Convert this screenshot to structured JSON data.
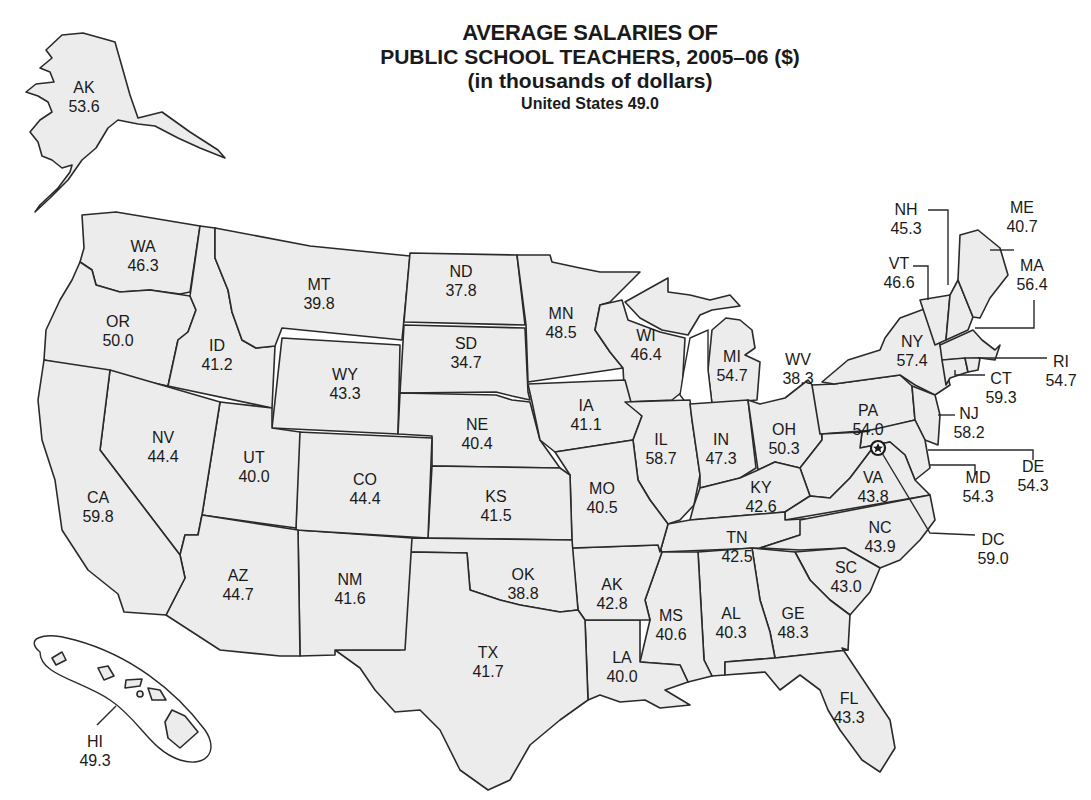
{
  "title": {
    "line1": "AVERAGE SALARIES OF",
    "line2": "PUBLIC SCHOOL TEACHERS, 2005–06 ($)",
    "line3": "(in thousands of dollars)",
    "line4": "United States 49.0"
  },
  "colors": {
    "state_fill": "#ececec",
    "outline": "#2a2a2a",
    "background": "#ffffff",
    "text": "#1a1a1a"
  },
  "icons": {
    "capital_marker": "star-icon"
  },
  "states": [
    {
      "code": "AK",
      "value": "53.6",
      "x": 84,
      "y": 78
    },
    {
      "code": "WA",
      "value": "46.3",
      "x": 143,
      "y": 237
    },
    {
      "code": "OR",
      "value": "50.0",
      "x": 118,
      "y": 312
    },
    {
      "code": "ID",
      "value": "41.2",
      "x": 217,
      "y": 336
    },
    {
      "code": "MT",
      "value": "39.8",
      "x": 319,
      "y": 275
    },
    {
      "code": "WY",
      "value": "43.3",
      "x": 345,
      "y": 365
    },
    {
      "code": "ND",
      "value": "37.8",
      "x": 461,
      "y": 262
    },
    {
      "code": "SD",
      "value": "34.7",
      "x": 466,
      "y": 334
    },
    {
      "code": "MN",
      "value": "48.5",
      "x": 561,
      "y": 304
    },
    {
      "code": "WI",
      "value": "46.4",
      "x": 646,
      "y": 326
    },
    {
      "code": "MI",
      "value": "54.7",
      "x": 732,
      "y": 347
    },
    {
      "code": "WV",
      "value": "38.3",
      "x": 798,
      "y": 350
    },
    {
      "code": "NE",
      "value": "40.4",
      "x": 477,
      "y": 415
    },
    {
      "code": "IA",
      "value": "41.1",
      "x": 586,
      "y": 396
    },
    {
      "code": "IL",
      "value": "58.7",
      "x": 661,
      "y": 430
    },
    {
      "code": "IN",
      "value": "47.3",
      "x": 721,
      "y": 430
    },
    {
      "code": "OH",
      "value": "50.3",
      "x": 784,
      "y": 420
    },
    {
      "code": "PA",
      "value": "54.0",
      "x": 868,
      "y": 401
    },
    {
      "code": "NV",
      "value": "44.4",
      "x": 163,
      "y": 428
    },
    {
      "code": "UT",
      "value": "40.0",
      "x": 254,
      "y": 448
    },
    {
      "code": "CO",
      "value": "44.4",
      "x": 365,
      "y": 470
    },
    {
      "code": "CA",
      "value": "59.8",
      "x": 98,
      "y": 488
    },
    {
      "code": "KS",
      "value": "41.5",
      "x": 496,
      "y": 487
    },
    {
      "code": "MO",
      "value": "40.5",
      "x": 602,
      "y": 479
    },
    {
      "code": "KY",
      "value": "42.6",
      "x": 761,
      "y": 478
    },
    {
      "code": "VA",
      "value": "43.8",
      "x": 873,
      "y": 468
    },
    {
      "code": "TN",
      "value": "42.5",
      "x": 737,
      "y": 528
    },
    {
      "code": "NC",
      "value": "43.9",
      "x": 880,
      "y": 518
    },
    {
      "code": "AZ",
      "value": "44.7",
      "x": 238,
      "y": 566
    },
    {
      "code": "NM",
      "value": "41.6",
      "x": 350,
      "y": 570
    },
    {
      "code": "OK",
      "value": "38.8",
      "x": 523,
      "y": 565
    },
    {
      "code": "AK",
      "value": "42.8",
      "x": 612,
      "y": 575
    },
    {
      "code": "SC",
      "value": "43.0",
      "x": 846,
      "y": 558
    },
    {
      "code": "MS",
      "value": "40.6",
      "x": 671,
      "y": 606
    },
    {
      "code": "AL",
      "value": "40.3",
      "x": 731,
      "y": 604
    },
    {
      "code": "GE",
      "value": "48.3",
      "x": 793,
      "y": 604
    },
    {
      "code": "LA",
      "value": "40.0",
      "x": 622,
      "y": 648
    },
    {
      "code": "TX",
      "value": "41.7",
      "x": 488,
      "y": 643
    },
    {
      "code": "FL",
      "value": "43.3",
      "x": 849,
      "y": 689
    },
    {
      "code": "HI",
      "value": "49.3",
      "x": 95,
      "y": 732
    }
  ],
  "callouts": [
    {
      "code": "NH",
      "value": "45.3",
      "x": 906,
      "y": 200
    },
    {
      "code": "VT",
      "value": "46.6",
      "x": 899,
      "y": 254
    },
    {
      "code": "ME",
      "value": "40.7",
      "x": 1022,
      "y": 198
    },
    {
      "code": "MA",
      "value": "56.4",
      "x": 1032,
      "y": 256
    },
    {
      "code": "NY",
      "value": "57.4",
      "x": 912,
      "y": 332
    },
    {
      "code": "RI",
      "value": "54.7",
      "x": 1061,
      "y": 352
    },
    {
      "code": "CT",
      "value": "59.3",
      "x": 1001,
      "y": 369
    },
    {
      "code": "NJ",
      "value": "58.2",
      "x": 969,
      "y": 404
    },
    {
      "code": "DE",
      "value": "54.3",
      "x": 1033,
      "y": 457
    },
    {
      "code": "MD",
      "value": "54.3",
      "x": 978,
      "y": 468
    },
    {
      "code": "DC",
      "value": "59.0",
      "x": 993,
      "y": 530
    }
  ]
}
